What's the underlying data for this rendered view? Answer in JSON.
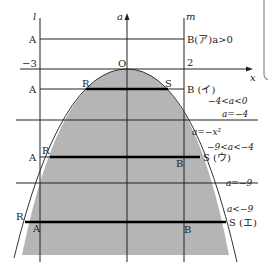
{
  "diagram": {
    "colors": {
      "region": "#b5b5b5",
      "line": "#222222",
      "thick": "#000000",
      "background": "#ffffff"
    },
    "axes": {
      "l_label": "l",
      "m_label": "m",
      "a_label": "a",
      "x_label": "x",
      "origin_label": "O",
      "l_value": "−3",
      "m_value": "2"
    },
    "curve_label": "a=−x²",
    "cases": [
      {
        "left": "A",
        "right": "B(ア)a>0"
      },
      {
        "left_a": "A",
        "left_r": "R",
        "right_s": "S",
        "right_b": "B (イ)",
        "condition": "−4<a<0"
      },
      {
        "boundary": "a=−4"
      },
      {
        "left_a": "A",
        "left_r": "R",
        "right_b": "B",
        "right_s": "S (ウ)",
        "condition": "−9<a<−4"
      },
      {
        "boundary": "a=−9"
      },
      {
        "left_r": "R",
        "left_a": "A",
        "right_b": "B",
        "right_s": "S (エ)",
        "condition": "a<−9"
      }
    ]
  }
}
